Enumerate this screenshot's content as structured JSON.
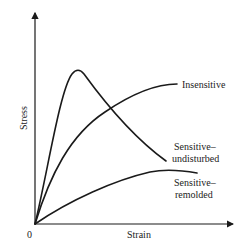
{
  "diagram": {
    "type": "stress-strain-curves",
    "axes": {
      "x_label": "Strain",
      "y_label": "Stress",
      "origin_label": "0"
    },
    "curves": [
      {
        "id": "sensitive-undisturbed",
        "label_line1": "Sensitive–",
        "label_line2": "undisturbed",
        "description": "sharp early peak then strain-softening"
      },
      {
        "id": "insensitive",
        "label_line1": "Insensitive",
        "label_line2": "",
        "description": "monotonic rise to plateau"
      },
      {
        "id": "sensitive-remolded",
        "label_line1": "Sensitive–",
        "label_line2": "remolded",
        "description": "low gradual rise to plateau"
      }
    ],
    "colors": {
      "line": "#1a1a1a",
      "background": "#ffffff"
    }
  }
}
